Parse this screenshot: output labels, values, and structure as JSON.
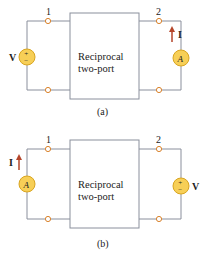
{
  "colors": {
    "wire": "#8a8f9c",
    "terminal": "#d9822b",
    "source_fill": "#f7cf57",
    "source_stroke": "#d9a520",
    "arrow": "#b5452a",
    "text": "#222222"
  },
  "circuits": [
    {
      "caption": "(a)",
      "box_line1": "Reciprocal",
      "box_line2": "two-port",
      "port1_label": "1",
      "port2_label": "2",
      "left_element": {
        "type": "voltage-source",
        "label": "V",
        "plus": "+",
        "minus": "−"
      },
      "right_element": {
        "type": "ammeter",
        "symbol": "A",
        "current_label": "I"
      }
    },
    {
      "caption": "(b)",
      "box_line1": "Reciprocal",
      "box_line2": "two-port",
      "port1_label": "1",
      "port2_label": "2",
      "left_element": {
        "type": "ammeter",
        "symbol": "A",
        "current_label": "I"
      },
      "right_element": {
        "type": "voltage-source",
        "label": "V",
        "plus": "+",
        "minus": "−"
      }
    }
  ]
}
